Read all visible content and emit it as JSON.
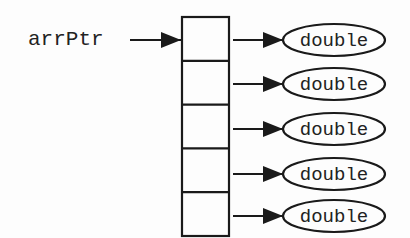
{
  "diagram": {
    "pointer": {
      "label": "arrPtr"
    },
    "array": {
      "element_count": 5
    },
    "elements": [
      {
        "type_label": "double"
      },
      {
        "type_label": "double"
      },
      {
        "type_label": "double"
      },
      {
        "type_label": "double"
      },
      {
        "type_label": "double"
      }
    ],
    "colors": {
      "ink": "#1a1a1a",
      "text": "#222222",
      "background": "#fdfdfd"
    }
  }
}
